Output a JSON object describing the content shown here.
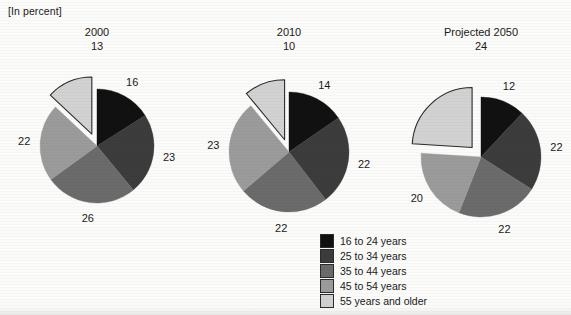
{
  "header": {
    "unit_note": "[In percent]"
  },
  "chart_data": {
    "type": "pie",
    "title": "",
    "unit_label": "[In percent]",
    "categories": [
      "16 to 24 years",
      "25 to 34 years",
      "35 to 44 years",
      "45 to 54 years",
      "55 years and older"
    ],
    "colors": [
      "#111111",
      "#3c3c3c",
      "#6b6b6b",
      "#9b9b9b",
      "#d2d2d2"
    ],
    "exploded_slice": "55 years and older",
    "legend_position": "bottom-right",
    "charts": [
      {
        "title": "2000",
        "top_value": "13",
        "values": [
          16,
          23,
          26,
          22,
          13
        ],
        "labels": [
          "16",
          "23",
          "26",
          "22",
          "13"
        ]
      },
      {
        "title": "2010",
        "top_value": "10",
        "values": [
          14,
          22,
          22,
          23,
          10
        ],
        "labels": [
          "14",
          "22",
          "22",
          "23",
          "10"
        ]
      },
      {
        "title": "Projected 2050",
        "top_value": "24",
        "values": [
          12,
          22,
          22,
          20,
          24
        ],
        "labels": [
          "12",
          "22",
          "22",
          "20",
          "24"
        ]
      }
    ]
  },
  "legend": {
    "items": [
      {
        "label": "16 to 24 years",
        "color": "#111111"
      },
      {
        "label": "25 to 34 years",
        "color": "#3c3c3c"
      },
      {
        "label": "35 to 44 years",
        "color": "#6b6b6b"
      },
      {
        "label": "45 to 54 years",
        "color": "#9b9b9b"
      },
      {
        "label": "55 years and older",
        "color": "#d2d2d2"
      }
    ]
  }
}
